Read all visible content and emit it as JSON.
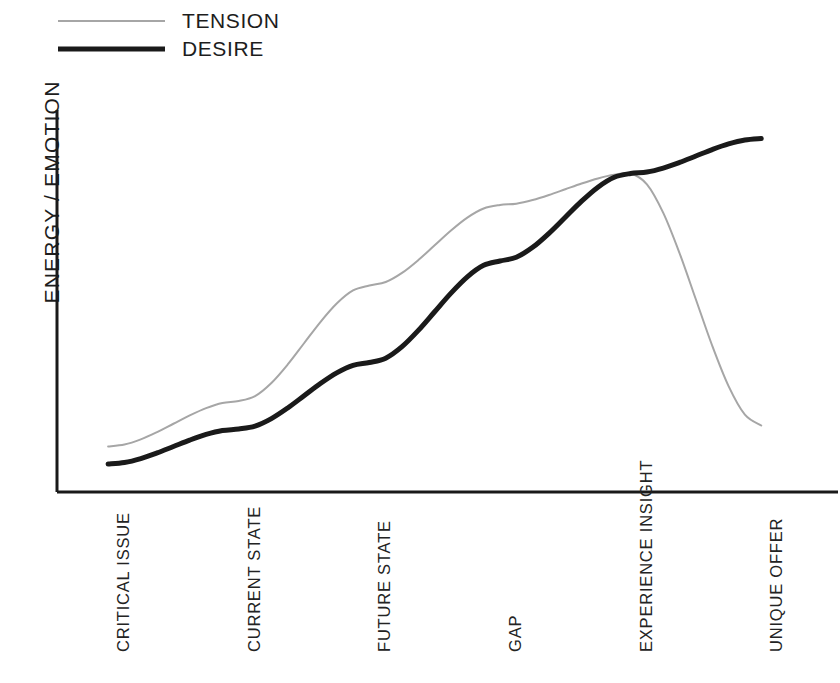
{
  "chart_data": {
    "type": "line",
    "title": "",
    "xlabel": "",
    "ylabel": "ENERGY / EMOTION",
    "categories": [
      "CRITICAL ISSUE",
      "CURRENT STATE",
      "FUTURE STATE",
      "GAP",
      "EXPERIENCE INSIGHT",
      "UNIQUE OFFER"
    ],
    "x": [
      0,
      1,
      2,
      3,
      4,
      5
    ],
    "xlim": [
      -0.2,
      5.45
    ],
    "ylim": [
      0,
      100
    ],
    "grid": false,
    "legend_position": "top-left",
    "axes": {
      "y_axis_visible": true,
      "x_axis_visible": true,
      "ticks_visible": false,
      "tick_labels_rotation": -90,
      "y_tick_labels": [],
      "x_tick_labels": [
        "CRITICAL ISSUE",
        "CURRENT STATE",
        "FUTURE STATE",
        "GAP",
        "EXPERIENCE INSIGHT",
        "UNIQUE OFFER"
      ]
    },
    "series": [
      {
        "name": "TENSION",
        "color": "#a6a6a6",
        "line_width": 2,
        "values": [
          9,
          22,
          55,
          78,
          87,
          15
        ],
        "annotation": "rises steeply to a peak at EXPERIENCE INSIGHT, then falls sharply"
      },
      {
        "name": "DESIRE",
        "color": "#1a1a1a",
        "line_width": 5,
        "values": [
          4,
          14,
          33,
          62,
          87,
          97
        ],
        "annotation": "rises in an S-curve and plateaus at UNIQUE OFFER"
      }
    ],
    "crossover": {
      "category": "EXPERIENCE INSIGHT",
      "value": 87,
      "description": "TENSION peak and DESIRE intersect"
    }
  },
  "legend": {
    "items": [
      {
        "label": "TENSION",
        "swatch": "tension-line-swatch",
        "color": "#a6a6a6"
      },
      {
        "label": "DESIRE",
        "swatch": "desire-line-swatch",
        "color": "#1a1a1a"
      }
    ]
  },
  "axis": {
    "y_title": "ENERGY / EMOTION"
  },
  "x_labels": [
    "CRITICAL ISSUE",
    "CURRENT STATE",
    "FUTURE STATE",
    "GAP",
    "EXPERIENCE INSIGHT",
    "UNIQUE OFFER"
  ]
}
